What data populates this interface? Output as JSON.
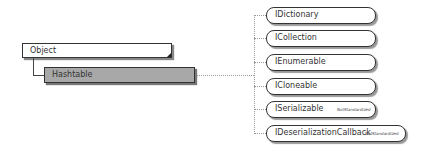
{
  "diagram": {
    "base_class": "Object",
    "class": "Hashtable",
    "interfaces": [
      {
        "name": "IDictionary",
        "note": ""
      },
      {
        "name": "ICollection",
        "note": ""
      },
      {
        "name": "IEnumerable",
        "note": ""
      },
      {
        "name": "ICloneable",
        "note": ""
      },
      {
        "name": "ISerializable",
        "note": "NotStandardized"
      },
      {
        "name": "IDeserializationCallback",
        "note": "NotStandardized"
      }
    ]
  }
}
